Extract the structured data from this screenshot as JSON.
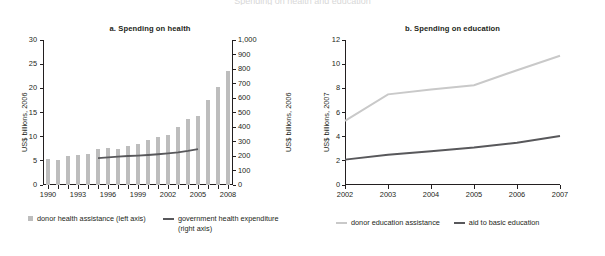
{
  "figure": {
    "title": "Spending on health and education"
  },
  "panel_a": {
    "title": "a.  Spending on health",
    "y_left_label": "US$ billions, 2006",
    "y_right_label": "US$ billions, 2006",
    "y_left_ticks": [
      "0",
      "5",
      "10",
      "15",
      "20",
      "25",
      "30"
    ],
    "y_right_ticks": [
      "0",
      "100",
      "200",
      "300",
      "400",
      "500",
      "600",
      "700",
      "800",
      "900",
      "1,000"
    ],
    "x_ticks": [
      "1990",
      "1993",
      "1996",
      "1999",
      "2002",
      "2005",
      "2008"
    ],
    "legend": [
      {
        "label": "donor health assistance (left axis)",
        "marker": "square",
        "color": "#bdbdbd"
      },
      {
        "label": "government health expenditure (right axis)",
        "marker": "line",
        "color": "#58585b"
      }
    ]
  },
  "panel_b": {
    "title": "b.  Spending on education",
    "y_label": "US$ billions, 2007",
    "y_ticks": [
      "0",
      "2",
      "4",
      "6",
      "8",
      "10",
      "12"
    ],
    "x_ticks": [
      "2002",
      "2003",
      "2004",
      "2005",
      "2006",
      "2007"
    ],
    "legend": [
      {
        "label": "donor education assistance",
        "marker": "line",
        "color": "#c9c9c9"
      },
      {
        "label": "aid to basic education",
        "marker": "line",
        "color": "#58585b"
      }
    ]
  },
  "chart_data": [
    {
      "type": "bar",
      "title": "a.  Spending on health",
      "xlabel": "",
      "ylabel": "US$ billions, 2006",
      "ylabel_right": "US$ billions, 2006",
      "ylim": [
        0,
        30
      ],
      "ylim_right": [
        0,
        1000
      ],
      "grid": false,
      "legend_position": "below",
      "categories": [
        1990,
        1991,
        1992,
        1993,
        1994,
        1995,
        1996,
        1997,
        1998,
        1999,
        2000,
        2001,
        2002,
        2003,
        2004,
        2005,
        2006,
        2007,
        2008
      ],
      "series": [
        {
          "name": "donor health assistance (left axis)",
          "axis": "left",
          "type": "bar",
          "color": "#bdbdbd",
          "values": [
            5.4,
            5.1,
            6.0,
            6.3,
            6.5,
            7.4,
            7.7,
            7.5,
            8.0,
            8.5,
            9.3,
            10.0,
            10.4,
            11.9,
            13.7,
            14.3,
            17.5,
            20.2,
            23.6
          ]
        },
        {
          "name": "government health expenditure (right axis)",
          "axis": "right",
          "type": "line",
          "color": "#58585b",
          "x": [
            1995,
            1996,
            1997,
            1998,
            1999,
            2000,
            2001,
            2002,
            2003,
            2004,
            2005
          ],
          "values": [
            185,
            190,
            195,
            200,
            203,
            207,
            212,
            218,
            225,
            235,
            247
          ]
        }
      ]
    },
    {
      "type": "line",
      "title": "b.  Spending on education",
      "xlabel": "",
      "ylabel": "US$ billions, 2007",
      "ylim": [
        0,
        12
      ],
      "grid": false,
      "legend_position": "below",
      "x": [
        2002,
        2003,
        2004,
        2005,
        2006,
        2007
      ],
      "series": [
        {
          "name": "donor education assistance",
          "color": "#c9c9c9",
          "values": [
            5.3,
            7.5,
            7.9,
            8.25,
            9.5,
            10.7
          ]
        },
        {
          "name": "aid to basic education",
          "color": "#58585b",
          "values": [
            2.1,
            2.5,
            2.8,
            3.1,
            3.5,
            4.05
          ]
        }
      ]
    }
  ]
}
